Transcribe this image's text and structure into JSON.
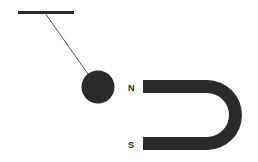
{
  "diagram": {
    "labels": {
      "north": "N",
      "south": "S"
    },
    "colors": {
      "ink": "#2a2a2a",
      "string": "#555555",
      "background": "#ffffff"
    }
  }
}
